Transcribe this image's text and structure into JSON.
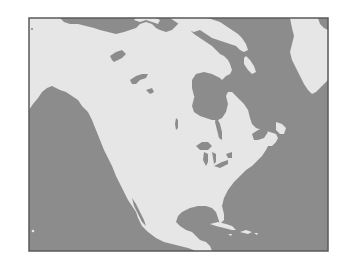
{
  "map": {
    "subject": "North America",
    "style": "grayscale",
    "labels": [],
    "colors": {
      "land": "#e6e6e6",
      "water": "#8c8c8c",
      "frame": "#5a5a5a",
      "background": "#ffffff"
    },
    "frame": {
      "x": 29,
      "y": 18,
      "width": 299,
      "height": 233
    },
    "regions": [
      {
        "name": "North American mainland",
        "type": "land"
      },
      {
        "name": "Greenland",
        "type": "land"
      },
      {
        "name": "Canadian Arctic Archipelago",
        "type": "land"
      },
      {
        "name": "Pacific Ocean",
        "type": "water"
      },
      {
        "name": "Atlantic Ocean",
        "type": "water"
      },
      {
        "name": "Arctic Ocean",
        "type": "water"
      },
      {
        "name": "Hudson Bay",
        "type": "water"
      },
      {
        "name": "Gulf of Mexico",
        "type": "water"
      },
      {
        "name": "Caribbean Sea",
        "type": "water"
      },
      {
        "name": "Great Lakes",
        "type": "water"
      },
      {
        "name": "Great Bear Lake",
        "type": "water"
      },
      {
        "name": "Great Slave Lake",
        "type": "water"
      },
      {
        "name": "Cuba",
        "type": "land"
      },
      {
        "name": "Hispaniola",
        "type": "land"
      }
    ]
  }
}
